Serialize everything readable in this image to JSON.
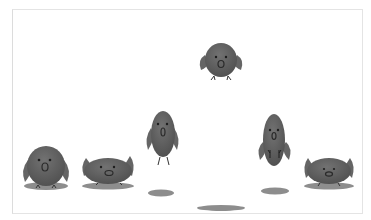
{
  "illustration": {
    "caption": "Bird jump animation sequence",
    "colors": {
      "body": "#5e5e5e",
      "body_light": "#787878",
      "wing": "#6a6a6a",
      "shadow": "#8a8a8a",
      "eye": "#1e1e1e",
      "frame_border": "#e4e4e4",
      "background": "#ffffff"
    },
    "frames": [
      {
        "pose": "standing",
        "x": 46,
        "y": 168
      },
      {
        "pose": "squash",
        "x": 108,
        "y": 172
      },
      {
        "pose": "stretch-rising",
        "x": 163,
        "y": 136
      },
      {
        "pose": "apex",
        "x": 221,
        "y": 62
      },
      {
        "pose": "stretch-falling",
        "x": 274,
        "y": 140
      },
      {
        "pose": "landing-squash",
        "x": 329,
        "y": 172
      }
    ]
  }
}
